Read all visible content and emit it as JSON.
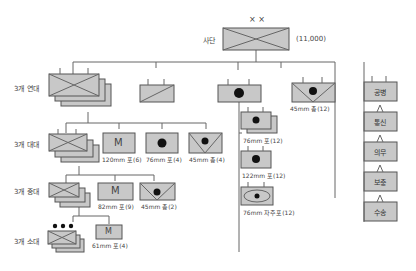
{
  "diagram": {
    "division": {
      "label": "사단",
      "echelon_mark": "× ×",
      "strength": "(11,000)"
    },
    "row_labels": {
      "regiment": "3개 연대",
      "battalion": "3개 대대",
      "company": "3개 중대",
      "platoon": "3개 소대"
    },
    "regiment_row": {
      "antitank_caption": "45mm 총(12)"
    },
    "battalion_row": {
      "mortar_caption": "120mm 포(6)",
      "gun_caption": "76mm 포(4)",
      "antitank_caption": "45mm 총(4)"
    },
    "company_row": {
      "mortar_caption": "82mm 포(9)",
      "antitank_caption": "45mm 총(2)"
    },
    "platoon_row": {
      "mortar_caption": "61mm 포(4)"
    },
    "artillery_column": {
      "items": [
        {
          "caption": "76mm 포(12)"
        },
        {
          "caption": "122mm 포(12)"
        },
        {
          "caption": "76mm 자주포(12)"
        }
      ]
    },
    "support_column": {
      "items": [
        {
          "label": "공병"
        },
        {
          "label": "통신"
        },
        {
          "label": "의무"
        },
        {
          "label": "보충"
        },
        {
          "label": "수송"
        }
      ]
    },
    "mortar_letter": "M",
    "colors": {
      "box_fill": "#c8c8c8",
      "stroke": "#555555",
      "line": "#666666"
    }
  }
}
